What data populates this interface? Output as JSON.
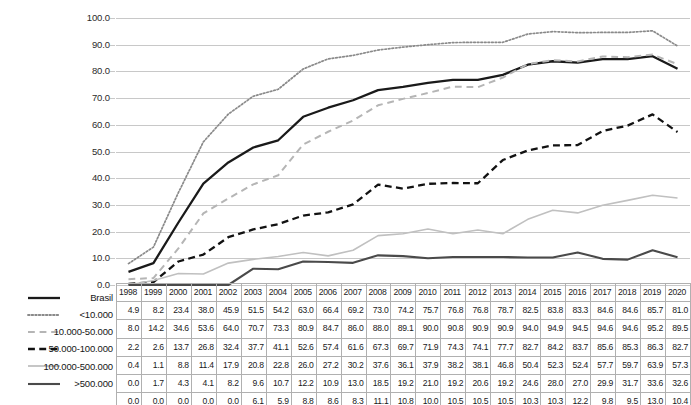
{
  "chart_data": {
    "type": "line",
    "title": "",
    "xlabel": "",
    "ylabel": "",
    "ylim": [
      0,
      100
    ],
    "ytick_step": 10,
    "grid": true,
    "legend_position": "left-below",
    "x": [
      "1998",
      "1999",
      "2000",
      "2001",
      "2002",
      "2003",
      "2004",
      "2005",
      "2006",
      "2007",
      "2008",
      "2009",
      "2010",
      "2011",
      "2012",
      "2013",
      "2014",
      "2015",
      "2016",
      "2017",
      "2018",
      "2019",
      "2020"
    ],
    "ytick_labels": [
      "0.0",
      "10.0",
      "20.0",
      "30.0",
      "40.0",
      "50.0",
      "60.0",
      "70.0",
      "80.0",
      "90.0",
      "100.0"
    ],
    "series": [
      {
        "name": "Brasil",
        "style": "solid",
        "color": "#1a1a1a",
        "width": 2.3,
        "values": [
          4.9,
          8.2,
          23.4,
          38.0,
          45.9,
          51.5,
          54.2,
          63.0,
          66.4,
          69.2,
          73.0,
          74.2,
          75.7,
          76.8,
          76.8,
          78.7,
          82.5,
          83.8,
          83.3,
          84.6,
          84.6,
          85.7,
          81.0
        ]
      },
      {
        "name": "<10.000",
        "style": "dotted",
        "color": "#8a8a8a",
        "width": 1.7,
        "values": [
          8.0,
          14.2,
          34.6,
          53.6,
          64.0,
          70.7,
          73.3,
          80.9,
          84.7,
          86.0,
          88.0,
          89.1,
          90.0,
          90.8,
          90.9,
          90.9,
          94.0,
          94.9,
          94.5,
          94.6,
          94.6,
          95.2,
          89.5
        ]
      },
      {
        "name": "10.000-50.000",
        "style": "dashed-light",
        "color": "#b5b5b5",
        "width": 2.0,
        "values": [
          2.2,
          2.6,
          13.7,
          26.8,
          32.4,
          37.7,
          41.1,
          52.6,
          57.4,
          61.6,
          67.3,
          69.7,
          71.9,
          74.3,
          74.1,
          77.7,
          82.7,
          84.2,
          83.7,
          85.6,
          85.3,
          86.3,
          82.7
        ]
      },
      {
        "name": "50.000-100.000",
        "style": "dashed-dark",
        "color": "#121212",
        "width": 2.3,
        "values": [
          0.4,
          1.1,
          8.8,
          11.4,
          17.9,
          20.8,
          22.8,
          26.0,
          27.2,
          30.2,
          37.6,
          36.1,
          37.9,
          38.2,
          38.1,
          46.8,
          50.4,
          52.3,
          52.4,
          57.7,
          59.7,
          63.9,
          57.3
        ]
      },
      {
        "name": "100.000-500.000",
        "style": "solid",
        "color": "#c0c0c0",
        "width": 1.6,
        "values": [
          0.0,
          1.7,
          4.3,
          4.1,
          8.2,
          9.6,
          10.7,
          12.2,
          10.9,
          13.0,
          18.5,
          19.2,
          21.0,
          19.2,
          20.6,
          19.2,
          24.6,
          28.0,
          27.0,
          29.9,
          31.7,
          33.6,
          32.6
        ]
      },
      {
        "name": ">500.000",
        "style": "solid",
        "color": "#4a4a4a",
        "width": 2.1,
        "values": [
          0.0,
          0.0,
          0.0,
          0.0,
          0.0,
          6.1,
          5.9,
          8.8,
          8.6,
          8.3,
          11.1,
          10.8,
          10.0,
          10.5,
          10.5,
          10.5,
          10.3,
          10.3,
          12.2,
          9.8,
          9.5,
          13.0,
          10.4
        ]
      }
    ]
  },
  "legend": {
    "items": [
      {
        "label": "Brasil"
      },
      {
        "label": "<10.000"
      },
      {
        "label": "10.000-50.000"
      },
      {
        "label": "50.000-100.000"
      },
      {
        "label": "100.000-500.000"
      },
      {
        "label": ">500.000"
      }
    ]
  },
  "caption": {
    "text": ""
  }
}
